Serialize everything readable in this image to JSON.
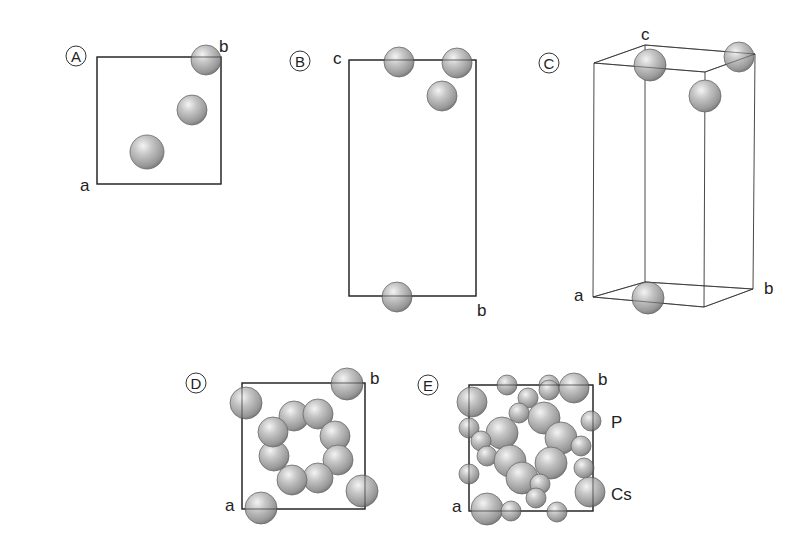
{
  "figure": {
    "colors": {
      "background": "#ffffff",
      "line": "#222222",
      "atom_highlight": "#f2f2f2",
      "atom_mid": "#b4b4b4",
      "atom_shadow": "#6e6e6e"
    }
  },
  "panels": [
    {
      "id": "A",
      "badge": "A",
      "badge_pos": [
        76,
        56
      ],
      "axes": [
        {
          "label": "a",
          "x": 80,
          "y": 191
        },
        {
          "label": "b",
          "x": 219,
          "y": 52
        }
      ],
      "cell": {
        "type": "rect",
        "x": 97,
        "y": 57,
        "w": 124,
        "h": 127
      },
      "atoms": [
        {
          "x": 206,
          "y": 60,
          "r": 15
        },
        {
          "x": 192,
          "y": 110,
          "r": 15
        },
        {
          "x": 147,
          "y": 152,
          "r": 17
        }
      ]
    },
    {
      "id": "B",
      "badge": "B",
      "badge_pos": [
        300,
        61
      ],
      "axes": [
        {
          "label": "c",
          "x": 333,
          "y": 64
        },
        {
          "label": "b",
          "x": 477,
          "y": 316
        }
      ],
      "cell": {
        "type": "rect",
        "x": 349,
        "y": 60,
        "w": 127,
        "h": 236
      },
      "atoms": [
        {
          "x": 399,
          "y": 62,
          "r": 15
        },
        {
          "x": 457,
          "y": 63,
          "r": 15
        },
        {
          "x": 442,
          "y": 96,
          "r": 15
        },
        {
          "x": 397,
          "y": 297,
          "r": 15
        }
      ]
    },
    {
      "id": "C",
      "badge": "C",
      "badge_pos": [
        549,
        63
      ],
      "axes": [
        {
          "label": "c",
          "x": 641,
          "y": 40
        },
        {
          "label": "a",
          "x": 574,
          "y": 301
        },
        {
          "label": "b",
          "x": 764,
          "y": 294
        }
      ],
      "cell": {
        "type": "box3d",
        "top": [
          [
            594,
            63
          ],
          [
            645,
            45
          ],
          [
            755,
            54
          ],
          [
            705,
            72
          ]
        ],
        "bottom": [
          [
            593,
            297
          ],
          [
            645,
            282
          ],
          [
            753,
            289
          ],
          [
            704,
            307
          ]
        ]
      },
      "atoms": [
        {
          "x": 650,
          "y": 65,
          "r": 16
        },
        {
          "x": 739,
          "y": 57,
          "r": 15
        },
        {
          "x": 705,
          "y": 96,
          "r": 16
        },
        {
          "x": 648,
          "y": 298,
          "r": 16
        }
      ]
    },
    {
      "id": "D",
      "badge": "D",
      "badge_pos": [
        196,
        383
      ],
      "axes": [
        {
          "label": "a",
          "x": 225,
          "y": 511
        },
        {
          "label": "b",
          "x": 370,
          "y": 384
        }
      ],
      "cell": {
        "type": "rect",
        "x": 242,
        "y": 383,
        "w": 123,
        "h": 126
      },
      "atoms": [
        {
          "x": 347,
          "y": 384,
          "r": 16
        },
        {
          "x": 246,
          "y": 403,
          "r": 16
        },
        {
          "x": 362,
          "y": 491,
          "r": 16
        },
        {
          "x": 261,
          "y": 508,
          "r": 16
        },
        {
          "x": 294,
          "y": 416,
          "r": 15
        },
        {
          "x": 318,
          "y": 414,
          "r": 15
        },
        {
          "x": 335,
          "y": 436,
          "r": 15
        },
        {
          "x": 338,
          "y": 460,
          "r": 15
        },
        {
          "x": 318,
          "y": 478,
          "r": 15
        },
        {
          "x": 292,
          "y": 480,
          "r": 15
        },
        {
          "x": 274,
          "y": 456,
          "r": 15
        },
        {
          "x": 273,
          "y": 432,
          "r": 15
        }
      ]
    },
    {
      "id": "E",
      "badge": "E",
      "badge_pos": [
        428,
        385
      ],
      "axes": [
        {
          "label": "a",
          "x": 452,
          "y": 512
        },
        {
          "label": "b",
          "x": 598,
          "y": 385
        },
        {
          "label": "P",
          "x": 611,
          "y": 428
        },
        {
          "label": "Cs",
          "x": 611,
          "y": 500
        }
      ],
      "cell": {
        "type": "rect",
        "x": 469,
        "y": 385,
        "w": 124,
        "h": 126
      },
      "atoms": [
        {
          "x": 507,
          "y": 385,
          "r": 10
        },
        {
          "x": 549,
          "y": 385,
          "r": 10
        },
        {
          "x": 574,
          "y": 388,
          "r": 15
        },
        {
          "x": 549,
          "y": 390,
          "r": 10
        },
        {
          "x": 472,
          "y": 402,
          "r": 15
        },
        {
          "x": 528,
          "y": 398,
          "r": 10
        },
        {
          "x": 519,
          "y": 413,
          "r": 10
        },
        {
          "x": 544,
          "y": 418,
          "r": 16
        },
        {
          "x": 591,
          "y": 421,
          "r": 10
        },
        {
          "x": 469,
          "y": 428,
          "r": 10
        },
        {
          "x": 502,
          "y": 433,
          "r": 16
        },
        {
          "x": 481,
          "y": 441,
          "r": 10
        },
        {
          "x": 561,
          "y": 438,
          "r": 16
        },
        {
          "x": 581,
          "y": 446,
          "r": 10
        },
        {
          "x": 487,
          "y": 456,
          "r": 10
        },
        {
          "x": 510,
          "y": 461,
          "r": 16
        },
        {
          "x": 551,
          "y": 463,
          "r": 16
        },
        {
          "x": 584,
          "y": 468,
          "r": 10
        },
        {
          "x": 469,
          "y": 474,
          "r": 10
        },
        {
          "x": 522,
          "y": 478,
          "r": 16
        },
        {
          "x": 540,
          "y": 484,
          "r": 10
        },
        {
          "x": 590,
          "y": 492,
          "r": 15
        },
        {
          "x": 536,
          "y": 498,
          "r": 10
        },
        {
          "x": 487,
          "y": 509,
          "r": 16
        },
        {
          "x": 511,
          "y": 511,
          "r": 10
        },
        {
          "x": 557,
          "y": 512,
          "r": 10
        }
      ]
    }
  ],
  "labels": {
    "panel_A": "A",
    "panel_B": "B",
    "panel_C": "C",
    "panel_D": "D",
    "panel_E": "E",
    "A_a": "a",
    "A_b": "b",
    "B_c": "c",
    "B_b": "b",
    "C_c": "c",
    "C_a": "a",
    "C_b": "b",
    "D_a": "a",
    "D_b": "b",
    "E_a": "a",
    "E_b": "b",
    "E_P": "P",
    "E_Cs": "Cs"
  }
}
